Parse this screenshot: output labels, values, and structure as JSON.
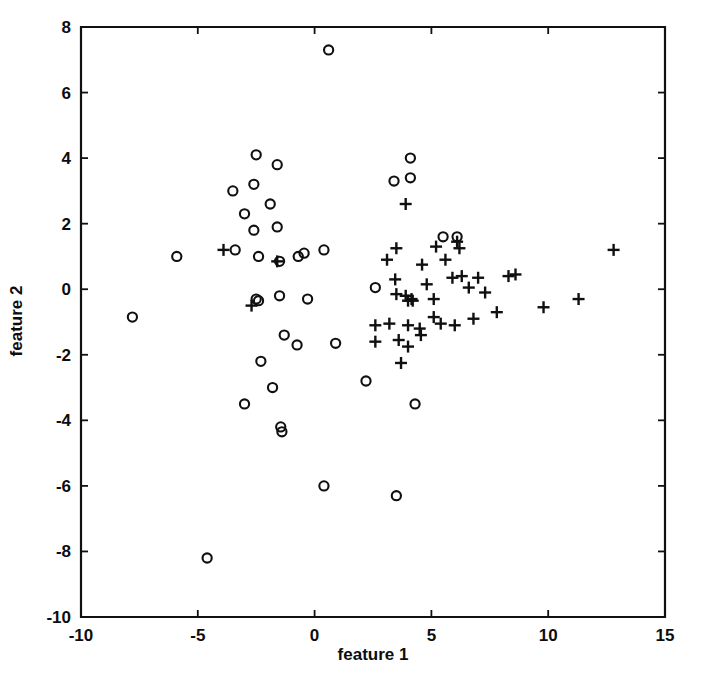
{
  "chart_data": {
    "type": "scatter",
    "title": "",
    "xlabel": "feature 1",
    "ylabel": "feature 2",
    "xlim": [
      -10,
      15
    ],
    "ylim": [
      -10,
      8
    ],
    "xticks": [
      -10,
      -5,
      0,
      5,
      10,
      15
    ],
    "yticks": [
      -10,
      -8,
      -6,
      -4,
      -2,
      0,
      2,
      4,
      6,
      8
    ],
    "xticklabels": [
      "-10",
      "-5",
      "0",
      "5",
      "10",
      "15"
    ],
    "yticklabels": [
      "-10",
      "-8",
      "-6",
      "-4",
      "-2",
      "0",
      "2",
      "4",
      "6",
      "8"
    ],
    "grid": false,
    "legend": null,
    "box": true,
    "series": [
      {
        "name": "class-o",
        "marker": "circle",
        "color": "#101010",
        "points": [
          [
            0.6,
            7.3
          ],
          [
            -2.5,
            4.1
          ],
          [
            -1.6,
            3.8
          ],
          [
            -3.5,
            3.0
          ],
          [
            -2.6,
            3.2
          ],
          [
            -3.0,
            2.3
          ],
          [
            -2.6,
            1.8
          ],
          [
            -1.9,
            2.6
          ],
          [
            -1.6,
            1.9
          ],
          [
            -5.9,
            1.0
          ],
          [
            -3.4,
            1.2
          ],
          [
            -2.4,
            1.0
          ],
          [
            -1.5,
            0.85
          ],
          [
            -0.7,
            1.0
          ],
          [
            -0.45,
            1.1
          ],
          [
            0.4,
            1.2
          ],
          [
            3.4,
            3.3
          ],
          [
            4.1,
            4.0
          ],
          [
            4.1,
            3.4
          ],
          [
            5.5,
            1.6
          ],
          [
            6.1,
            1.6
          ],
          [
            -7.8,
            -0.85
          ],
          [
            -2.5,
            -0.3
          ],
          [
            -2.4,
            -0.35
          ],
          [
            -1.5,
            -0.2
          ],
          [
            -0.3,
            -0.3
          ],
          [
            2.6,
            0.05
          ],
          [
            -2.3,
            -2.2
          ],
          [
            -1.3,
            -1.4
          ],
          [
            -0.75,
            -1.7
          ],
          [
            0.9,
            -1.65
          ],
          [
            -3.0,
            -3.5
          ],
          [
            -1.8,
            -3.0
          ],
          [
            -1.45,
            -4.2
          ],
          [
            -1.4,
            -4.35
          ],
          [
            2.2,
            -2.8
          ],
          [
            4.3,
            -3.5
          ],
          [
            0.4,
            -6.0
          ],
          [
            3.5,
            -6.3
          ],
          [
            -4.6,
            -8.2
          ]
        ]
      },
      {
        "name": "class-plus",
        "marker": "plus",
        "color": "#101010",
        "points": [
          [
            -3.9,
            1.2
          ],
          [
            -2.7,
            -0.5
          ],
          [
            -1.6,
            0.85
          ],
          [
            3.9,
            2.6
          ],
          [
            2.6,
            -1.1
          ],
          [
            3.1,
            0.9
          ],
          [
            3.5,
            1.25
          ],
          [
            3.45,
            0.3
          ],
          [
            3.5,
            -0.15
          ],
          [
            3.9,
            -0.2
          ],
          [
            4.0,
            -0.35
          ],
          [
            4.15,
            -0.3
          ],
          [
            4.2,
            -0.35
          ],
          [
            4.6,
            0.75
          ],
          [
            4.8,
            0.15
          ],
          [
            5.1,
            -0.3
          ],
          [
            5.2,
            1.3
          ],
          [
            5.6,
            0.9
          ],
          [
            5.9,
            0.35
          ],
          [
            6.1,
            1.45
          ],
          [
            6.2,
            1.25
          ],
          [
            6.3,
            0.4
          ],
          [
            6.6,
            0.05
          ],
          [
            7.0,
            0.35
          ],
          [
            7.3,
            -0.1
          ],
          [
            7.8,
            -0.7
          ],
          [
            8.3,
            0.4
          ],
          [
            8.6,
            0.45
          ],
          [
            9.8,
            -0.55
          ],
          [
            11.3,
            -0.3
          ],
          [
            12.8,
            1.2
          ],
          [
            2.6,
            -1.6
          ],
          [
            3.2,
            -1.05
          ],
          [
            4.0,
            -1.1
          ],
          [
            4.5,
            -1.2
          ],
          [
            4.55,
            -1.4
          ],
          [
            5.1,
            -0.85
          ],
          [
            5.4,
            -1.05
          ],
          [
            6.0,
            -1.1
          ],
          [
            6.8,
            -0.9
          ],
          [
            3.7,
            -2.25
          ],
          [
            3.6,
            -1.55
          ],
          [
            4.0,
            -1.75
          ]
        ]
      }
    ]
  },
  "axis": {
    "xlabel": "feature 1",
    "ylabel": "feature 2"
  }
}
